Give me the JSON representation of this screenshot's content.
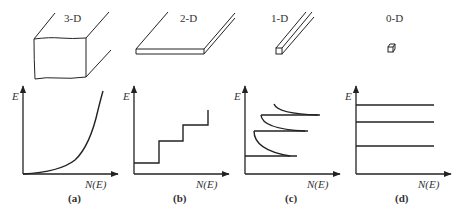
{
  "figure": {
    "panels": [
      {
        "id": "a",
        "caption": "(a)",
        "dimension_label": "3-D",
        "y_axis_label": "E",
        "x_axis_label": "N(E)",
        "curve": "parabolic (sqrt-like) continuous density of states"
      },
      {
        "id": "b",
        "caption": "(b)",
        "dimension_label": "2-D",
        "y_axis_label": "E",
        "x_axis_label": "N(E)",
        "curve": "staircase step function"
      },
      {
        "id": "c",
        "caption": "(c)",
        "dimension_label": "1-D",
        "y_axis_label": "E",
        "x_axis_label": "N(E)",
        "curve": "inverse square-root spikes at subband edges"
      },
      {
        "id": "d",
        "caption": "(d)",
        "dimension_label": "0-D",
        "y_axis_label": "E",
        "x_axis_label": "N(E)",
        "curve": "discrete delta-like levels"
      }
    ]
  },
  "colors": {
    "line": "#222222",
    "background": "#ffffff",
    "text": "#333333"
  }
}
